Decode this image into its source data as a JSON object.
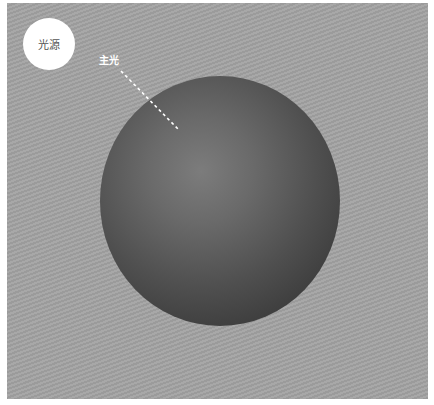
{
  "diagram": {
    "title": "",
    "light_source": {
      "label": "光源",
      "fill_color": "#ffffff"
    },
    "key_light": {
      "label": "主光",
      "line_style": "dashed",
      "line_color": "#ffffff"
    },
    "sphere": {
      "shading": "radial",
      "highlight_color": "#7c7c7c",
      "shadow_color": "#333333"
    },
    "background_color": "#a3a3a3"
  }
}
